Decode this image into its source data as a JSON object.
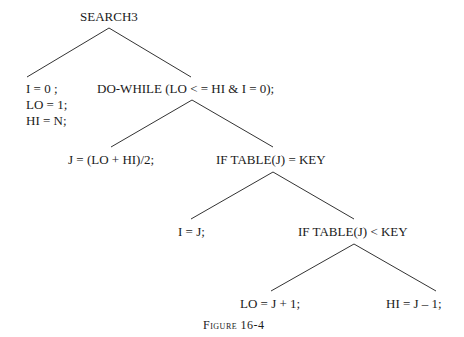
{
  "diagram": {
    "root": "SEARCH3",
    "init_block": [
      "I = 0 ;",
      "LO = 1;",
      "HI = N;"
    ],
    "loop": "DO-WHILE (LO < = HI & I = 0);",
    "compute_mid": "J = (LO + HI)/2;",
    "if_equal": "IF TABLE(J) = KEY",
    "found": "I = J;",
    "if_less": "IF TABLE(J) < KEY",
    "move_lo": "LO = J + 1;",
    "move_hi": "HI = J – 1;"
  },
  "caption": "Figure 16-4",
  "colors": {
    "line": "#333333",
    "text": "#1a1a1a",
    "background": "#ffffff"
  }
}
